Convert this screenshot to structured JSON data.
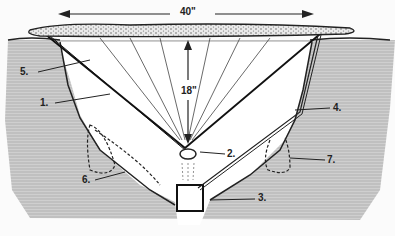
{
  "diagram": {
    "type": "solar-still-cross-section",
    "dimensions": {
      "width": "40\"",
      "depth": "18\""
    },
    "labels": [
      {
        "id": "1",
        "text": "1."
      },
      {
        "id": "2",
        "text": "2."
      },
      {
        "id": "3",
        "text": "3."
      },
      {
        "id": "4",
        "text": "4."
      },
      {
        "id": "5",
        "text": "5."
      },
      {
        "id": "6",
        "text": "6."
      },
      {
        "id": "7",
        "text": "7."
      }
    ],
    "colors": {
      "ground": "#b8b8b8",
      "ink": "#1a1a1a",
      "pit": "#ffffff"
    }
  }
}
